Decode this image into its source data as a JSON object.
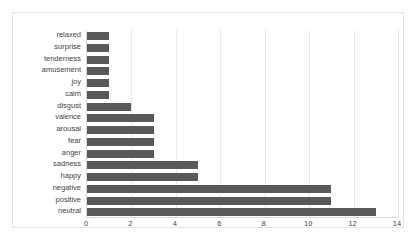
{
  "chart_data": {
    "type": "bar",
    "orientation": "horizontal",
    "title": "",
    "subtitle": "",
    "xlabel": "",
    "ylabel": "",
    "categories": [
      "relaxed",
      "surprise",
      "tenderness",
      "amusement",
      "joy",
      "calm",
      "disgust",
      "valence",
      "arousal",
      "fear",
      "anger",
      "sadness",
      "happy",
      "negative",
      "positive",
      "neutral"
    ],
    "values": [
      1,
      1,
      1,
      1,
      1,
      1,
      2,
      3,
      3,
      3,
      3,
      5,
      5,
      11,
      11,
      13
    ],
    "xlim": [
      0,
      14
    ],
    "xticks": [
      0,
      2,
      4,
      6,
      8,
      10,
      12,
      14
    ],
    "xtick_labels": [
      "0",
      "2",
      "4",
      "6",
      "8",
      "10",
      "12",
      "14"
    ],
    "grid": "vertical",
    "legend": "none",
    "series": [
      {
        "name": "count",
        "values": [
          1,
          1,
          1,
          1,
          1,
          1,
          2,
          3,
          3,
          3,
          3,
          5,
          5,
          11,
          11,
          13
        ]
      }
    ],
    "colors": {
      "bar": "#595959",
      "gridline": "#e8e8e8",
      "axis": "#d9d9d9",
      "frame": "#e4e4e4",
      "background": "#ffffff",
      "text": "#3f3f3f"
    }
  }
}
